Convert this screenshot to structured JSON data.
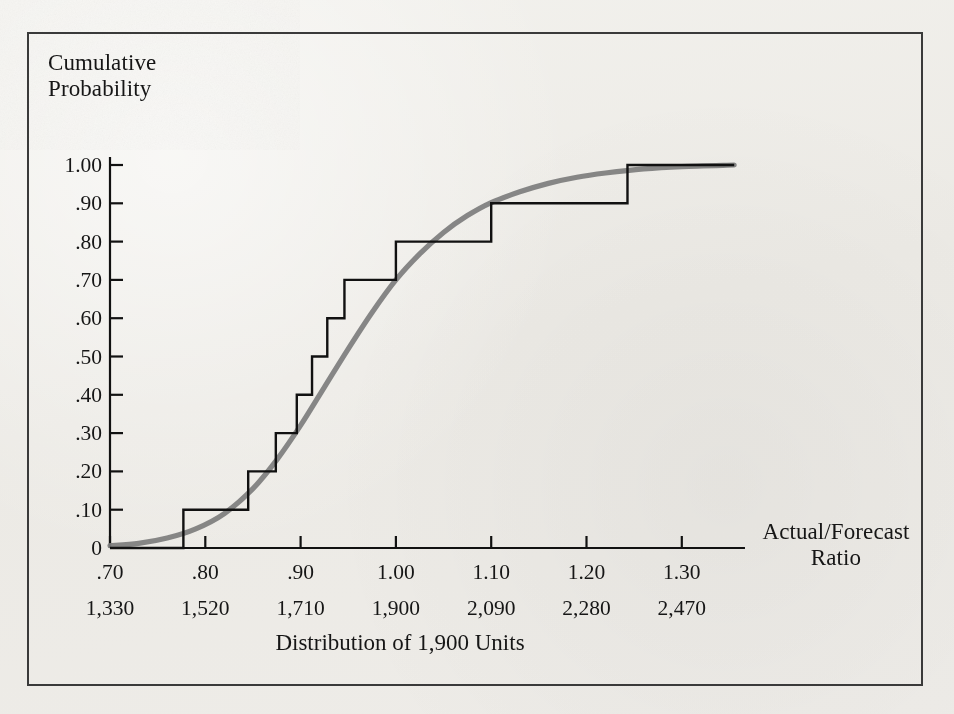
{
  "figure": {
    "y_axis_title": "Cumulative\nProbability",
    "x_axis_title": "Actual/Forecast\nRatio",
    "caption": "Distribution of 1,900 Units",
    "frame_color": "#3a3a3a",
    "step_color": "#111111",
    "curve_color": "#7d7d7d",
    "background_color": "#efeeea"
  },
  "ticks": {
    "y_labels": [
      "1.00",
      ".90",
      ".80",
      ".70",
      ".60",
      ".50",
      ".40",
      ".30",
      ".20",
      ".10",
      "0"
    ],
    "y_values": [
      1.0,
      0.9,
      0.8,
      0.7,
      0.6,
      0.5,
      0.4,
      0.3,
      0.2,
      0.1,
      0.0
    ],
    "x_labels": [
      ".70",
      ".80",
      ".90",
      "1.00",
      "1.10",
      "1.20",
      "1.30"
    ],
    "x_values": [
      0.7,
      0.8,
      0.9,
      1.0,
      1.1,
      1.2,
      1.3
    ],
    "x_labels_units": [
      "1,330",
      "1,520",
      "1,710",
      "1,900",
      "2,090",
      "2,280",
      "2,470"
    ]
  },
  "chart_data": {
    "type": "line",
    "title": "Distribution of 1,900 Units",
    "xlabel": "Actual/Forecast Ratio",
    "ylabel": "Cumulative Probability",
    "xlim": [
      0.7,
      1.36
    ],
    "ylim": [
      0.0,
      1.0
    ],
    "grid": false,
    "legend": "none",
    "x_secondary_axis": {
      "label": "Units",
      "tick_labels": [
        "1,330",
        "1,520",
        "1,710",
        "1,900",
        "2,090",
        "2,280",
        "2,470"
      ],
      "tick_values": [
        1330,
        1520,
        1710,
        1900,
        2090,
        2280,
        2470
      ],
      "note": "Units = Actual/Forecast Ratio x 1,900"
    },
    "series": [
      {
        "name": "Empirical cumulative distribution (step)",
        "style": "step-post",
        "color": "#111111",
        "x": [
          0.7,
          0.777,
          0.777,
          0.845,
          0.845,
          0.874,
          0.874,
          0.896,
          0.896,
          0.912,
          0.912,
          0.928,
          0.928,
          0.946,
          0.946,
          1.0,
          1.0,
          1.1,
          1.1,
          1.243,
          1.243,
          1.355
        ],
        "y": [
          0.0,
          0.0,
          0.1,
          0.1,
          0.2,
          0.2,
          0.3,
          0.3,
          0.4,
          0.4,
          0.5,
          0.5,
          0.6,
          0.6,
          0.7,
          0.7,
          0.8,
          0.8,
          0.9,
          0.9,
          1.0,
          1.0
        ],
        "jump_points": [
          {
            "x": 0.777,
            "from": 0.0,
            "to": 0.1
          },
          {
            "x": 0.845,
            "from": 0.1,
            "to": 0.2
          },
          {
            "x": 0.874,
            "from": 0.2,
            "to": 0.3
          },
          {
            "x": 0.896,
            "from": 0.3,
            "to": 0.4
          },
          {
            "x": 0.912,
            "from": 0.4,
            "to": 0.5
          },
          {
            "x": 0.928,
            "from": 0.5,
            "to": 0.6
          },
          {
            "x": 0.946,
            "from": 0.6,
            "to": 0.7
          },
          {
            "x": 1.0,
            "from": 0.7,
            "to": 0.8
          },
          {
            "x": 1.1,
            "from": 0.8,
            "to": 0.9
          },
          {
            "x": 1.243,
            "from": 0.9,
            "to": 1.0
          }
        ]
      },
      {
        "name": "Fitted smooth cumulative curve",
        "style": "smooth",
        "color": "#7d7d7d",
        "x": [
          0.7,
          0.73,
          0.76,
          0.79,
          0.82,
          0.85,
          0.875,
          0.9,
          0.925,
          0.95,
          0.975,
          1.0,
          1.025,
          1.05,
          1.075,
          1.1,
          1.13,
          1.16,
          1.19,
          1.22,
          1.26,
          1.3,
          1.355
        ],
        "y": [
          0.006,
          0.012,
          0.026,
          0.05,
          0.09,
          0.155,
          0.23,
          0.32,
          0.42,
          0.52,
          0.615,
          0.7,
          0.768,
          0.824,
          0.868,
          0.902,
          0.93,
          0.952,
          0.968,
          0.979,
          0.99,
          0.996,
          1.0
        ]
      }
    ]
  },
  "geometry": {
    "x_pixel_at_0_70": 110,
    "x_pixel_per_0_10": 95.3,
    "y_pixel_at_0": 548,
    "y_pixel_at_1": 165
  }
}
